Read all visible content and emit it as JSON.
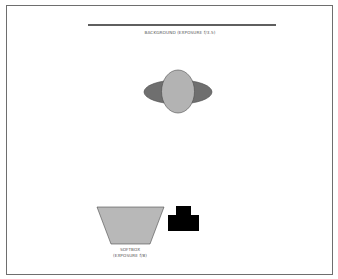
{
  "diagram": {
    "type": "lighting-setup",
    "background": {
      "label": "BACKGROUND (EXPOSURE f/3.5)",
      "line_color": "#2a2a2a"
    },
    "subject": {
      "head_color": "#b3b3b3",
      "shoulders_color": "#6f6f6f",
      "outline_color": "#4a4a4a"
    },
    "softbox": {
      "label_line1": "SOFTBOX",
      "label_line2": "(EXPOSURE f/8)",
      "fill_color": "#b8b8b8",
      "outline_color": "#4a4a4a"
    },
    "camera": {
      "fill_color": "#000000"
    },
    "frame_color": "#6e6e6e"
  }
}
